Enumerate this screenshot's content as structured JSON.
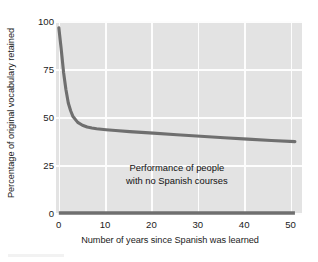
{
  "chart_data": {
    "type": "line",
    "title": "",
    "xlabel": "Number of years since Spanish was learned",
    "ylabel": "Percentage of original vocabulary retained",
    "xlim": [
      -0.6,
      51.5
    ],
    "ylim": [
      0,
      100
    ],
    "xticks": [
      0,
      10,
      20,
      30,
      40,
      50
    ],
    "xticklabels": [
      "0",
      "10",
      "20",
      "30",
      "40",
      "50"
    ],
    "yticks": [
      0,
      25,
      50,
      75,
      100
    ],
    "yticklabels": [
      "0",
      "25",
      "50",
      "75",
      "100"
    ],
    "grid": true,
    "legend": "none",
    "plot_background": "#e3e3e3",
    "grid_color": "#fdfdfd",
    "line_color": "#6f6f6f",
    "annotations": [
      {
        "name": "no-courses-annotation",
        "line1": "Performance of people",
        "line2": "with no Spanish courses",
        "x": 25,
        "y": 13
      }
    ],
    "series": [
      {
        "name": "Vocabulary retained after Spanish courses",
        "x": [
          0,
          0.5,
          1,
          1.5,
          2,
          2.5,
          3,
          4,
          5,
          6,
          7,
          8,
          10,
          12,
          15,
          20,
          25,
          30,
          35,
          40,
          45,
          50
        ],
        "values": [
          97,
          86,
          74,
          65,
          58,
          54,
          51,
          48,
          46.5,
          45.6,
          45.1,
          44.7,
          44.2,
          43.8,
          43.2,
          42.4,
          41.6,
          40.8,
          40.0,
          39.3,
          38.6,
          38.0
        ]
      },
      {
        "name": "Performance of people with no Spanish courses",
        "x": [
          0,
          50
        ],
        "values": [
          1,
          1
        ]
      }
    ]
  }
}
